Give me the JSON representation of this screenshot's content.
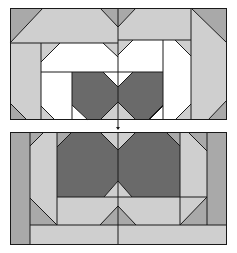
{
  "diagram": {
    "title": "Quilt block layout — two colorway variants",
    "width": 237,
    "height": 253,
    "colors": {
      "white": "#ffffff",
      "light": "#cfcfcf",
      "mid": "#a9a9a9",
      "dark": "#6a6a6a",
      "outline": "#1a1a1a"
    },
    "panels": [
      {
        "name": "top-panel",
        "offset_y": 0,
        "frame": [
          10,
          8,
          227,
          120
        ],
        "shapes": [
          {
            "fill": "mid",
            "points": "10,8 43,8 10,43"
          },
          {
            "fill": "light",
            "points": "43,8 100,8 118,27 118,43 10,43"
          },
          {
            "fill": "mid",
            "points": "100,8 118,8 118,27"
          },
          {
            "fill": "mid",
            "points": "118,8 136,8 118,27"
          },
          {
            "fill": "light",
            "points": "136,8 191,8 191,40 118,40 118,27"
          },
          {
            "fill": "mid",
            "points": "191,8 227,8 227,43"
          },
          {
            "fill": "light",
            "points": "191,8 227,43 227,108 191,40"
          },
          {
            "fill": "light",
            "points": "10,43 41,43 41,120 10,120"
          },
          {
            "fill": "mid",
            "points": "10,103 27,120 10,120"
          },
          {
            "fill": "light",
            "points": "41,43 60,43 41,62"
          },
          {
            "fill": "white",
            "points": "60,43 103,43 118,57 118,72 41,72 41,62"
          },
          {
            "fill": "light",
            "points": "103,43 118,43 118,57"
          },
          {
            "fill": "light",
            "points": "118,40 133,40 118,55"
          },
          {
            "fill": "white",
            "points": "133,40 163,40 163,72 118,72 118,55"
          },
          {
            "fill": "white",
            "points": "163,40 175,40 191,56 191,120 163,120"
          },
          {
            "fill": "light",
            "points": "175,40 191,40 191,56"
          },
          {
            "fill": "light",
            "points": "191,108 227,108 227,120 191,120"
          },
          {
            "fill": "mid",
            "points": "227,100 227,120 208,120"
          },
          {
            "fill": "white",
            "points": "41,72 72,72 72,120 41,120"
          },
          {
            "fill": "light",
            "points": "41,106 55,120 41,120"
          },
          {
            "fill": "light",
            "points": "163,106 163,120 149,120"
          },
          {
            "fill": "light",
            "points": "191,104 191,120 175,120"
          },
          {
            "fill": "dark",
            "points": "72,72 103,72 118,87 118,102 100,120 88,120 72,105"
          },
          {
            "fill": "white",
            "points": "103,72 133,72 118,87"
          },
          {
            "fill": "dark",
            "points": "133,72 163,72 163,105 148,120 136,120 118,102 118,87"
          },
          {
            "fill": "white",
            "points": "72,105 88,120 72,120"
          },
          {
            "fill": "light",
            "points": "100,120 118,102 136,120"
          },
          {
            "fill": "white",
            "points": "163,105 163,120 148,120"
          }
        ],
        "lines": [
          "10,43 118,43",
          "118,40 191,40",
          "41,72 163,72",
          "41,43 41,120",
          "72,72 72,120",
          "163,40 163,120",
          "191,8 191,120",
          "118,8 118,120",
          "10,43 43,8",
          "100,8 118,27",
          "118,27 136,8",
          "191,8 227,43",
          "41,62 60,43",
          "103,43 118,57",
          "118,55 133,40",
          "175,40 191,56",
          "10,103 27,120",
          "227,100 208,120",
          "41,106 55,120",
          "163,106 149,120",
          "191,104 175,120",
          "72,105 88,120",
          "100,120 118,102",
          "118,102 136,120",
          "148,120 163,105",
          "103,72 118,87",
          "118,87 133,72"
        ]
      },
      {
        "name": "bottom-panel",
        "offset_y": 0,
        "frame": [
          10,
          132,
          227,
          245
        ],
        "shapes": [
          {
            "fill": "mid",
            "points": "10,132 30,132 30,245 10,245"
          },
          {
            "fill": "light",
            "points": "30,132 57,132 57,225 30,225"
          },
          {
            "fill": "mid",
            "points": "30,132 44,132 30,146"
          },
          {
            "fill": "mid",
            "points": "30,198 57,225 30,225"
          },
          {
            "fill": "mid",
            "points": "57,132 72,132 57,147"
          },
          {
            "fill": "dark",
            "points": "72,132 100,132 118,150 118,181 104,197 57,197 57,147"
          },
          {
            "fill": "light",
            "points": "100,132 136,132 118,150"
          },
          {
            "fill": "dark",
            "points": "136,132 166,132 180,146 180,197 132,197 118,181 118,150"
          },
          {
            "fill": "mid",
            "points": "166,132 180,132 180,146"
          },
          {
            "fill": "light",
            "points": "104,197 118,181 132,197"
          },
          {
            "fill": "light",
            "points": "180,132 207,132 207,225 180,225"
          },
          {
            "fill": "mid",
            "points": "188,132 207,132 207,151"
          },
          {
            "fill": "mid",
            "points": "207,132 227,132 227,225 207,225"
          },
          {
            "fill": "light",
            "points": "57,197 207,197 180,225 57,225"
          },
          {
            "fill": "mid",
            "points": "118,206 100,225 136,225"
          },
          {
            "fill": "mid",
            "points": "207,197 207,225 180,225"
          },
          {
            "fill": "light",
            "points": "30,225 227,225 227,245 30,245"
          }
        ],
        "lines": [
          "30,132 30,245",
          "57,132 57,225",
          "180,132 180,225",
          "207,132 207,225",
          "57,197 207,197",
          "30,225 227,225",
          "118,132 118,245",
          "30,146 44,132",
          "57,147 72,132",
          "100,132 118,150",
          "118,150 136,132",
          "166,132 180,146",
          "188,132 207,151",
          "30,198 57,225",
          "104,197 118,181",
          "118,181 132,197",
          "100,225 118,206",
          "118,206 136,225",
          "180,225 207,197"
        ]
      }
    ],
    "arrow": {
      "x": 118,
      "y1": 124,
      "y2": 129,
      "glyph": "▼"
    }
  }
}
